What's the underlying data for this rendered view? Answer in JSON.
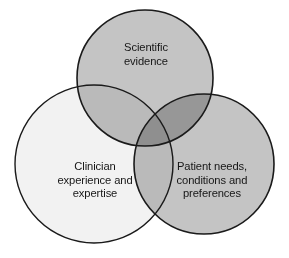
{
  "diagram": {
    "type": "venn",
    "title": "",
    "background_color": "#ffffff",
    "stroke_color": "#1a1a1a",
    "text_color": "#161616",
    "sets": [
      {
        "id": "scientific-evidence",
        "label": "Scientific\nevidence",
        "position": "top",
        "fill_color": "#c4c4c4",
        "center_x": 145,
        "center_y": 78,
        "radius": 68
      },
      {
        "id": "clinician-experience",
        "label": "Clinician\nexperience and\nexpertise",
        "position": "bottom-left",
        "fill_color": "#f2f2f2",
        "center_x": 94,
        "center_y": 164,
        "radius": 79
      },
      {
        "id": "patient-needs",
        "label": "Patient needs,\nconditions and\npreferences",
        "position": "bottom-right",
        "fill_color": "#c4c4c4",
        "center_x": 204,
        "center_y": 164,
        "radius": 70
      }
    ]
  }
}
